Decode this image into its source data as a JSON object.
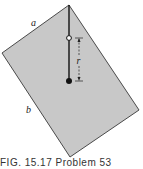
{
  "figure": {
    "labels": {
      "a": "a",
      "b": "b",
      "r": "r"
    },
    "caption": "FIG. 15.17   Problem 53",
    "colors": {
      "plate_fill": "#c8c8c8",
      "plate_stroke": "#4a4a4a",
      "rod": "#111111"
    }
  }
}
